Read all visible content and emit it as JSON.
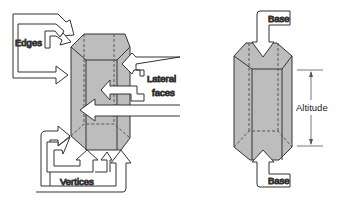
{
  "colors": {
    "prism_fill": "#bdbdbd",
    "prism_top": "#c8c8c8",
    "stroke": "#333333",
    "background": "#ffffff"
  },
  "left_figure": {
    "labels": {
      "edges": "Edges",
      "lateral_line1": "Lateral",
      "lateral_line2": "faces",
      "vertices": "Vertices"
    }
  },
  "right_figure": {
    "labels": {
      "base_top": "Base",
      "altitude": "Altitude",
      "base_bottom": "Base"
    }
  }
}
